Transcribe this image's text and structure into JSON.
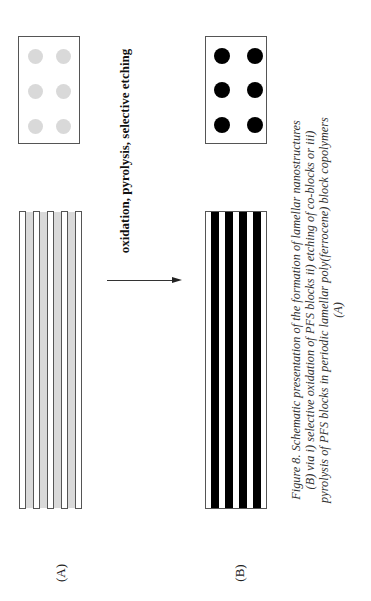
{
  "figure": {
    "process_label": "oxidation, pyrolysis, selective etching",
    "panel_labels": {
      "a": "(A)",
      "b": "(B)"
    },
    "caption_lines": [
      "Figure 8. Schematic presentation of the formation of lamellar nanostructures",
      "(B) via  i) selective oxidation of PFS blocks ii) etching of co-blocks or iii)",
      "pyrolysis of PFS blocks in periodic lamellar poly(ferrocene) block copolymers",
      "(A)"
    ],
    "colors": {
      "precursor_fill": "#d9d9d9",
      "product_fill": "#000000",
      "border": "#555555"
    }
  }
}
